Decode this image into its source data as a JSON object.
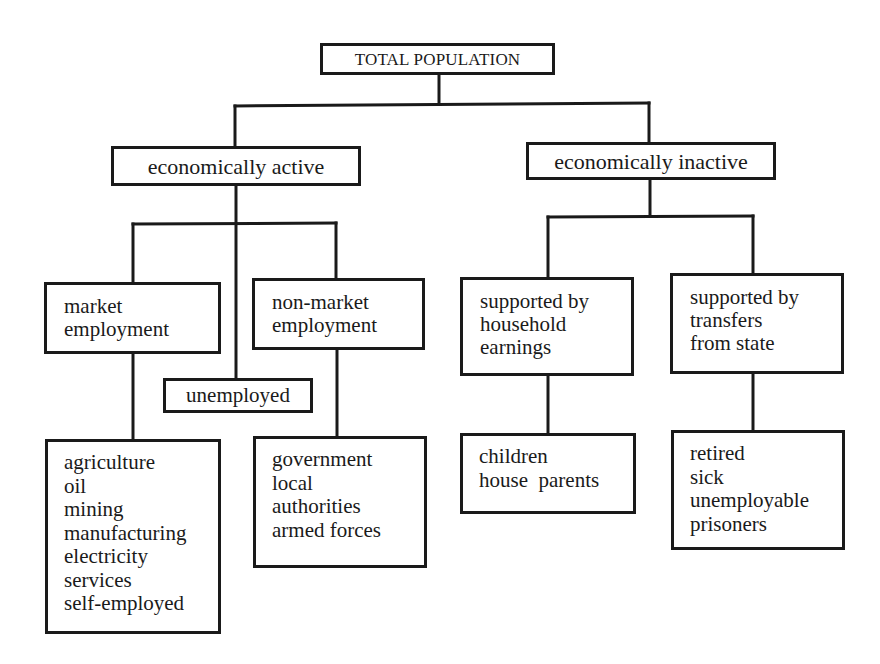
{
  "diagram": {
    "root": {
      "label": "TOTAL POPULATION"
    },
    "active": {
      "label": "economically active",
      "market": {
        "label": "market\nemployment",
        "items": "agriculture\noil\nmining\nmanufacturing\nelectricity\nservices\nself-employed"
      },
      "unemployed": {
        "label": "unemployed"
      },
      "non_market": {
        "label": "non-market\nemployment",
        "items": "government\nlocal\nauthorities\narmed forces"
      }
    },
    "inactive": {
      "label": "economically inactive",
      "household": {
        "label": "supported by\nhousehold\nearnings",
        "items": "children\nhouse  parents"
      },
      "state": {
        "label": "supported by\ntransfers\nfrom state",
        "items": "retired\nsick\nunemployable\nprisoners"
      }
    }
  },
  "colors": {
    "line": "#1a1a1a",
    "background": "#ffffff"
  }
}
